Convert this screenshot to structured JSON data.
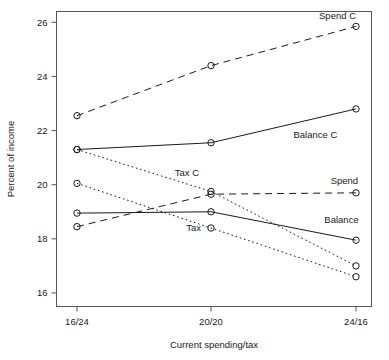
{
  "chart_data": {
    "type": "line",
    "title": "",
    "xlabel": "Current spending/tax",
    "ylabel": "Percent of income",
    "categories": [
      "16/24",
      "20/20",
      "24/16"
    ],
    "x": [
      0,
      1,
      2
    ],
    "ylim": [
      15.5,
      26.4
    ],
    "yticks": [
      16,
      18,
      20,
      22,
      24,
      26
    ],
    "ytick_labels": [
      "16",
      "18",
      "20",
      "22",
      "24",
      "26"
    ],
    "xtick_labels": [
      "16/24",
      "20/20",
      "24/16"
    ],
    "grid": false,
    "legend_position": "inline-annotations",
    "markers": "open-circle",
    "series": [
      {
        "name": "Spend C",
        "label": "Spend C",
        "linestyle": "dashed",
        "values": [
          22.55,
          24.4,
          25.85
        ]
      },
      {
        "name": "Balance C",
        "label": "Balance C",
        "linestyle": "solid",
        "values": [
          21.3,
          21.55,
          22.8
        ]
      },
      {
        "name": "Tax C",
        "label": "Tax C",
        "linestyle": "dotted",
        "values": [
          21.3,
          19.75,
          17.0
        ]
      },
      {
        "name": "Spend",
        "label": "Spend",
        "linestyle": "dashed",
        "values": [
          18.45,
          19.65,
          19.7
        ]
      },
      {
        "name": "Balance",
        "label": "Balance",
        "linestyle": "solid",
        "values": [
          18.95,
          19.0,
          17.95
        ]
      },
      {
        "name": "Tax",
        "label": "Tax",
        "linestyle": "dotted",
        "values": [
          20.05,
          18.4,
          16.6
        ]
      }
    ],
    "annotations": [
      {
        "text": "Spend C",
        "x": 2,
        "y": 26.25,
        "anchor": "end"
      },
      {
        "text": "Balance C",
        "x": 1.72,
        "y": 21.85,
        "anchor": "middle"
      },
      {
        "text": "Tax C",
        "x": 0.82,
        "y": 20.45,
        "anchor": "middle"
      },
      {
        "text": "Spend",
        "x": 1.92,
        "y": 20.15,
        "anchor": "middle"
      },
      {
        "text": "Balance",
        "x": 1.9,
        "y": 18.72,
        "anchor": "middle"
      },
      {
        "text": "Tax",
        "x": 0.87,
        "y": 18.42,
        "anchor": "middle"
      }
    ]
  }
}
